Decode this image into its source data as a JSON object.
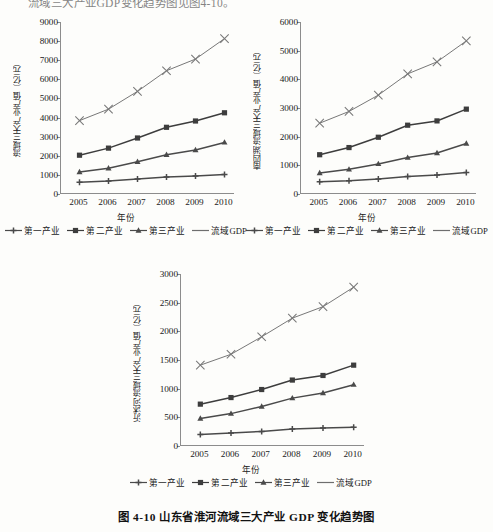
{
  "page": {
    "top_cut_text": "流域三大产业GDP变化趋势图见图4-10。",
    "caption": "图 4-10   山东省淮河流域三大产业 GDP 变化趋势图"
  },
  "legend": {
    "items": [
      {
        "label": "第一产业",
        "marker": "plus",
        "color": "#4a4a4a"
      },
      {
        "label": "第二产业",
        "marker": "square",
        "color": "#3d3d3d"
      },
      {
        "label": "第三产业",
        "marker": "triangle",
        "color": "#4a4a4a"
      },
      {
        "label": "流域GDP",
        "marker": "line",
        "color": "#6e6e6e"
      }
    ]
  },
  "chart_data": [
    {
      "id": "chart-shandong-huaihe-basin",
      "type": "line",
      "title": "",
      "xlabel": "年份",
      "ylabel": "流域三大产业产值（亿元）",
      "x": [
        "2005",
        "2006",
        "2007",
        "2008",
        "2009",
        "2010"
      ],
      "ylim": [
        0,
        9000
      ],
      "yticks": [
        0,
        1000,
        2000,
        3000,
        4000,
        5000,
        6000,
        7000,
        8000,
        9000
      ],
      "grid": false,
      "legend_position": "bottom",
      "series": [
        {
          "name": "第一产业",
          "marker": "plus",
          "values": [
            620,
            680,
            780,
            890,
            940,
            1020
          ]
        },
        {
          "name": "第二产业",
          "marker": "square",
          "values": [
            2030,
            2400,
            2930,
            3490,
            3820,
            4250
          ]
        },
        {
          "name": "第三产业",
          "marker": "triangle",
          "values": [
            1150,
            1350,
            1690,
            2050,
            2300,
            2700
          ]
        },
        {
          "name": "流域GDP",
          "marker": "cross",
          "values": [
            3840,
            4440,
            5370,
            6450,
            7060,
            8130
          ]
        }
      ]
    },
    {
      "id": "chart-nansihu-basin",
      "type": "line",
      "title": "",
      "xlabel": "年份",
      "ylabel": "南四湖流域三大产业产值（亿元）",
      "x": [
        "2005",
        "2006",
        "2007",
        "2008",
        "2009",
        "2010"
      ],
      "ylim": [
        0,
        6000
      ],
      "yticks": [
        0,
        1000,
        2000,
        3000,
        4000,
        5000,
        6000
      ],
      "grid": false,
      "legend_position": "bottom",
      "series": [
        {
          "name": "第一产业",
          "marker": "plus",
          "values": [
            430,
            460,
            520,
            610,
            660,
            750
          ]
        },
        {
          "name": "第二产业",
          "marker": "square",
          "values": [
            1370,
            1620,
            1980,
            2400,
            2550,
            2960
          ]
        },
        {
          "name": "第三产业",
          "marker": "triangle",
          "values": [
            730,
            860,
            1050,
            1270,
            1430,
            1760
          ]
        },
        {
          "name": "流域GDP",
          "marker": "cross",
          "values": [
            2470,
            2880,
            3450,
            4190,
            4610,
            5340
          ]
        }
      ]
    },
    {
      "id": "chart-yishuhe-basin",
      "type": "line",
      "title": "",
      "xlabel": "年份",
      "ylabel": "沂沭河流域三大产业产值（亿元）",
      "x": [
        "2005",
        "2006",
        "2007",
        "2008",
        "2009",
        "2010"
      ],
      "ylim": [
        0,
        3000
      ],
      "yticks": [
        0,
        500,
        1000,
        1500,
        2000,
        2500,
        3000
      ],
      "grid": false,
      "legend_position": "bottom",
      "series": [
        {
          "name": "第一产业",
          "marker": "plus",
          "values": [
            200,
            225,
            255,
            295,
            315,
            325
          ]
        },
        {
          "name": "第二产业",
          "marker": "square",
          "values": [
            730,
            845,
            985,
            1150,
            1230,
            1410
          ]
        },
        {
          "name": "第三产业",
          "marker": "triangle",
          "values": [
            480,
            565,
            690,
            835,
            925,
            1070
          ]
        },
        {
          "name": "流域GDP",
          "marker": "cross",
          "values": [
            1410,
            1600,
            1905,
            2230,
            2430,
            2770
          ]
        }
      ]
    }
  ]
}
